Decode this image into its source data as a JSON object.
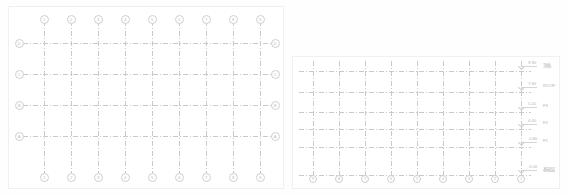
{
  "document": {
    "title": "Structural Grid Drawing",
    "view_count": 2,
    "background_color": "#ffffff",
    "line_color": "#c9c9c9",
    "bubble_color": "#cfcfcf",
    "text_color": "#b5b5b5"
  },
  "plan_view": {
    "name": "plan-view",
    "column_axes_top": [
      "1",
      "2",
      "3",
      "4",
      "5",
      "6",
      "7",
      "8",
      "9"
    ],
    "column_axes_bottom": [
      "1",
      "2",
      "3",
      "4",
      "5",
      "6",
      "7",
      "8",
      "9"
    ],
    "row_axes_left": [
      "D",
      "C",
      "B",
      "A"
    ],
    "row_axes_right": [
      "D",
      "C",
      "B",
      "A"
    ],
    "column_x": [
      43,
      70,
      97,
      124,
      151,
      178,
      205,
      232,
      259
    ],
    "row_y": [
      42,
      73,
      104,
      135
    ]
  },
  "elevation_view": {
    "name": "elevation-view",
    "column_axes_bottom": [
      "9",
      "8",
      "7",
      "6",
      "5",
      "4",
      "3",
      "2",
      "1"
    ],
    "column_x": [
      312,
      338,
      364,
      390,
      416,
      442,
      468,
      494,
      520
    ],
    "levels": [
      {
        "elevation": "9.90",
        "name": "顶板",
        "y": 70
      },
      {
        "elevation": "7.90",
        "name": "ROOF",
        "y": 91
      },
      {
        "elevation": "5.10",
        "name": "F3",
        "y": 111
      },
      {
        "elevation": "4.00",
        "name": "F2",
        "y": 128
      },
      {
        "elevation": "-0.80",
        "name": "F1",
        "y": 146
      },
      {
        "elevation": "-3.00",
        "name": "基础层",
        "y": 174
      }
    ]
  }
}
